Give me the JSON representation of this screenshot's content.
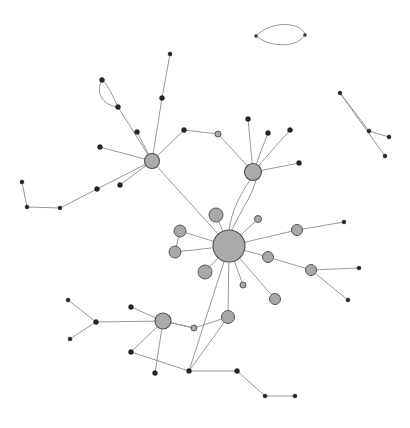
{
  "figure": {
    "width": 410,
    "height": 428,
    "background_color": "#ffffff"
  },
  "style": {
    "edge_color": "#8c8c8c",
    "hub_fill": "#aaaaaa",
    "hub_stroke": "#4d4d4d",
    "mid_fill": "#a8a8a8",
    "mid_stroke": "#585858",
    "dot_fill": "#262626"
  },
  "chart_data": {
    "type": "scatter",
    "xlabel": "",
    "ylabel": "",
    "xlim": [
      0,
      410
    ],
    "ylim": [
      0,
      428
    ],
    "grid": false,
    "legend": "none",
    "nodes": [
      {
        "id": "h1",
        "x": 152,
        "y": 161,
        "r": 7.5,
        "cls": "node-hub"
      },
      {
        "id": "h2",
        "x": 253,
        "y": 172,
        "r": 8.5,
        "cls": "node-hub"
      },
      {
        "id": "h3",
        "x": 229,
        "y": 246,
        "r": 16.0,
        "cls": "node-hub"
      },
      {
        "id": "h4",
        "x": 163,
        "y": 321,
        "r": 8.0,
        "cls": "node-hub"
      },
      {
        "id": "m1",
        "x": 216,
        "y": 215,
        "r": 7.0,
        "cls": "node-mid"
      },
      {
        "id": "m2",
        "x": 180,
        "y": 231,
        "r": 6.0,
        "cls": "node-mid"
      },
      {
        "id": "m3",
        "x": 175,
        "y": 252,
        "r": 6.0,
        "cls": "node-mid"
      },
      {
        "id": "m4",
        "x": 205,
        "y": 272,
        "r": 7.0,
        "cls": "node-mid"
      },
      {
        "id": "m5",
        "x": 258,
        "y": 219,
        "r": 3.5,
        "cls": "node-mid"
      },
      {
        "id": "m6",
        "x": 297,
        "y": 230,
        "r": 5.5,
        "cls": "node-mid"
      },
      {
        "id": "m7",
        "x": 268,
        "y": 257,
        "r": 5.5,
        "cls": "node-mid"
      },
      {
        "id": "m8",
        "x": 311,
        "y": 270,
        "r": 5.5,
        "cls": "node-mid"
      },
      {
        "id": "m9",
        "x": 275,
        "y": 299,
        "r": 5.5,
        "cls": "node-mid"
      },
      {
        "id": "m10",
        "x": 228,
        "y": 317,
        "r": 6.5,
        "cls": "node-mid"
      },
      {
        "id": "m11",
        "x": 243,
        "y": 285,
        "r": 3.0,
        "cls": "node-mid"
      },
      {
        "id": "m12",
        "x": 194,
        "y": 328,
        "r": 3.0,
        "cls": "node-mid"
      },
      {
        "id": "m13",
        "x": 218,
        "y": 134,
        "r": 3.0,
        "cls": "node-mid"
      },
      {
        "id": "a1",
        "x": 170,
        "y": 54,
        "r": 2.0,
        "cls": "node-dot"
      },
      {
        "id": "a2",
        "x": 162,
        "y": 98,
        "r": 2.5,
        "cls": "node-dot"
      },
      {
        "id": "a3",
        "x": 102,
        "y": 80,
        "r": 2.5,
        "cls": "node-dot"
      },
      {
        "id": "a4",
        "x": 118,
        "y": 107,
        "r": 2.5,
        "cls": "node-dot"
      },
      {
        "id": "a5",
        "x": 137,
        "y": 132,
        "r": 2.5,
        "cls": "node-dot"
      },
      {
        "id": "a6",
        "x": 100,
        "y": 147,
        "r": 2.5,
        "cls": "node-dot"
      },
      {
        "id": "a7",
        "x": 184,
        "y": 130,
        "r": 2.5,
        "cls": "node-dot"
      },
      {
        "id": "a8",
        "x": 120,
        "y": 185,
        "r": 2.5,
        "cls": "node-dot"
      },
      {
        "id": "a9",
        "x": 97,
        "y": 189,
        "r": 2.5,
        "cls": "node-dot"
      },
      {
        "id": "a10",
        "x": 60,
        "y": 208,
        "r": 2.0,
        "cls": "node-dot"
      },
      {
        "id": "a11",
        "x": 27,
        "y": 207,
        "r": 2.0,
        "cls": "node-dot"
      },
      {
        "id": "a12",
        "x": 22,
        "y": 182,
        "r": 2.0,
        "cls": "node-dot"
      },
      {
        "id": "b1",
        "x": 248,
        "y": 119,
        "r": 2.5,
        "cls": "node-dot"
      },
      {
        "id": "b2",
        "x": 268,
        "y": 133,
        "r": 2.5,
        "cls": "node-dot"
      },
      {
        "id": "b3",
        "x": 290,
        "y": 130,
        "r": 2.5,
        "cls": "node-dot"
      },
      {
        "id": "b4",
        "x": 299,
        "y": 163,
        "r": 2.5,
        "cls": "node-dot"
      },
      {
        "id": "c1",
        "x": 344,
        "y": 222,
        "r": 2.0,
        "cls": "node-dot"
      },
      {
        "id": "c2",
        "x": 359,
        "y": 268,
        "r": 2.0,
        "cls": "node-dot"
      },
      {
        "id": "c3",
        "x": 348,
        "y": 300,
        "r": 2.0,
        "cls": "node-dot"
      },
      {
        "id": "d1",
        "x": 96,
        "y": 322,
        "r": 2.5,
        "cls": "node-dot"
      },
      {
        "id": "d2",
        "x": 68,
        "y": 300,
        "r": 2.0,
        "cls": "node-dot"
      },
      {
        "id": "d3",
        "x": 70,
        "y": 339,
        "r": 2.0,
        "cls": "node-dot"
      },
      {
        "id": "d4",
        "x": 131,
        "y": 307,
        "r": 2.5,
        "cls": "node-dot"
      },
      {
        "id": "d5",
        "x": 131,
        "y": 352,
        "r": 2.5,
        "cls": "node-dot"
      },
      {
        "id": "d6",
        "x": 155,
        "y": 373,
        "r": 2.5,
        "cls": "node-dot"
      },
      {
        "id": "d7",
        "x": 189,
        "y": 371,
        "r": 2.5,
        "cls": "node-dot"
      },
      {
        "id": "d8",
        "x": 237,
        "y": 371,
        "r": 2.5,
        "cls": "node-dot"
      },
      {
        "id": "d9",
        "x": 265,
        "y": 396,
        "r": 2.0,
        "cls": "node-dot"
      },
      {
        "id": "d10",
        "x": 295,
        "y": 396,
        "r": 2.0,
        "cls": "node-dot"
      },
      {
        "id": "e1",
        "x": 256,
        "y": 36,
        "r": 1.8,
        "cls": "node-tiny"
      },
      {
        "id": "e2",
        "x": 305,
        "y": 35,
        "r": 1.8,
        "cls": "node-tiny"
      },
      {
        "id": "f1",
        "x": 340,
        "y": 93,
        "r": 2.0,
        "cls": "node-dot"
      },
      {
        "id": "f2",
        "x": 369,
        "y": 131,
        "r": 2.0,
        "cls": "node-dot"
      },
      {
        "id": "f3",
        "x": 389,
        "y": 137,
        "r": 2.0,
        "cls": "node-dot"
      },
      {
        "id": "f4",
        "x": 385,
        "y": 156,
        "r": 2.0,
        "cls": "node-dot"
      }
    ],
    "edges": [
      {
        "from": "h1",
        "to": "a2"
      },
      {
        "from": "a2",
        "to": "a1"
      },
      {
        "from": "h1",
        "to": "a4"
      },
      {
        "from": "h1",
        "to": "a5"
      },
      {
        "from": "h1",
        "to": "a6"
      },
      {
        "from": "h1",
        "to": "a7"
      },
      {
        "from": "a7",
        "to": "m13"
      },
      {
        "from": "m13",
        "to": "h2"
      },
      {
        "from": "h1",
        "to": "a8"
      },
      {
        "from": "h1",
        "to": "a9"
      },
      {
        "from": "a9",
        "to": "a10"
      },
      {
        "from": "a10",
        "to": "a11"
      },
      {
        "from": "a11",
        "to": "a12"
      },
      {
        "from": "h1",
        "to": "h3"
      },
      {
        "from": "h2",
        "to": "b1"
      },
      {
        "from": "h2",
        "to": "b2"
      },
      {
        "from": "h2",
        "to": "b3"
      },
      {
        "from": "h2",
        "to": "b4"
      },
      {
        "from": "h3",
        "to": "m1"
      },
      {
        "from": "h3",
        "to": "m2"
      },
      {
        "from": "h3",
        "to": "m3"
      },
      {
        "from": "h3",
        "to": "m4"
      },
      {
        "from": "m2",
        "to": "m3"
      },
      {
        "from": "h3",
        "to": "m5"
      },
      {
        "from": "h3",
        "to": "m6"
      },
      {
        "from": "m6",
        "to": "c1"
      },
      {
        "from": "h3",
        "to": "m7"
      },
      {
        "from": "m7",
        "to": "m8"
      },
      {
        "from": "m8",
        "to": "c2"
      },
      {
        "from": "m8",
        "to": "c3"
      },
      {
        "from": "h3",
        "to": "m9"
      },
      {
        "from": "h3",
        "to": "m11"
      },
      {
        "from": "h3",
        "to": "m10"
      },
      {
        "from": "h3",
        "to": "d7"
      },
      {
        "from": "m10",
        "to": "m12"
      },
      {
        "from": "m12",
        "to": "h4"
      },
      {
        "from": "m10",
        "to": "d7"
      },
      {
        "from": "h4",
        "to": "d1"
      },
      {
        "from": "d1",
        "to": "d2"
      },
      {
        "from": "d1",
        "to": "d3"
      },
      {
        "from": "h4",
        "to": "d4"
      },
      {
        "from": "h4",
        "to": "d5"
      },
      {
        "from": "h4",
        "to": "d6"
      },
      {
        "from": "h4",
        "to": "m12"
      },
      {
        "from": "d5",
        "to": "d7"
      },
      {
        "from": "d7",
        "to": "d8"
      },
      {
        "from": "d8",
        "to": "d9"
      },
      {
        "from": "d9",
        "to": "d10"
      },
      {
        "from": "f1",
        "to": "f4"
      },
      {
        "from": "f2",
        "to": "f3"
      },
      {
        "from": "f2",
        "to": "f1"
      }
    ],
    "curved_edges": [
      {
        "from": "e1",
        "to": "e2",
        "label": "loop-upper-top",
        "path": "M 256 36 C 272 20 300 22 305 34 C 300 47 272 49 256 36"
      },
      {
        "from": "a3",
        "to": "a4",
        "label": "loop-upper-left",
        "path": "M 102 80 C 95 92 102 105 118 107 C 112 95 109 86 102 80"
      },
      {
        "from": "h2",
        "to": "h3",
        "label": "double-edge-a",
        "path": "M 250 180 C 240 195 232 210 229 230"
      },
      {
        "from": "h2",
        "to": "h3",
        "label": "double-edge-b",
        "path": "M 256 180 C 252 196 240 212 232 230"
      }
    ],
    "node_count": 61,
    "edge_count": 55,
    "component_count": 4
  }
}
